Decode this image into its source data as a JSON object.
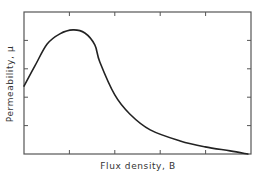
{
  "chart_data": {
    "type": "line",
    "title": "",
    "xlabel": "Flux density, B",
    "ylabel": "Permeability, μ",
    "xlim": [
      0,
      5
    ],
    "ylim": [
      0,
      5
    ],
    "x_ticks": [
      1,
      2,
      3,
      4
    ],
    "y_ticks": [
      1,
      2,
      3,
      4
    ],
    "tick_labels_shown": false,
    "grid": false,
    "legend": null,
    "frame": "box with inward ticks on all four sides",
    "series": [
      {
        "name": "Permeability vs flux density",
        "color": "#222222",
        "x": [
          0,
          0.24,
          0.51,
          0.79,
          1.08,
          1.34,
          1.56,
          1.67,
          2.0,
          2.33,
          2.78,
          3.44,
          3.99,
          4.54,
          4.93
        ],
        "y": [
          2.39,
          3.1,
          3.87,
          4.23,
          4.37,
          4.26,
          3.84,
          3.24,
          2.08,
          1.41,
          0.85,
          0.46,
          0.25,
          0.11,
          0.0
        ]
      }
    ]
  },
  "colors": {
    "background": "#ffffff",
    "axis": "#555555",
    "curve": "#222222",
    "text": "#333333"
  }
}
